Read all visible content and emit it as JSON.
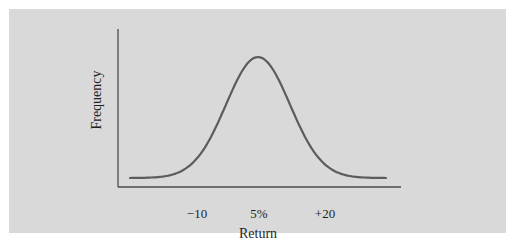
{
  "chart_data": {
    "type": "line",
    "title": "",
    "xlabel": "Return",
    "ylabel": "Frequency",
    "x_tick_labels": [
      "−10",
      "5%",
      "+20"
    ],
    "x_tick_values": [
      -10,
      5,
      20
    ],
    "series": [
      {
        "name": "Return distribution (normal curve)",
        "shape": "normal",
        "mean": 5,
        "std_dev": 7.5,
        "x": [
          -25,
          -20,
          -15,
          -10,
          -5,
          0,
          5,
          10,
          15,
          20,
          25,
          30,
          35
        ],
        "y": [
          0.03,
          0.06,
          0.18,
          0.42,
          0.68,
          0.9,
          1.0,
          0.9,
          0.68,
          0.42,
          0.18,
          0.06,
          0.03
        ]
      }
    ],
    "xlim": [
      -27,
      37
    ],
    "ylim": [
      0,
      1.12
    ],
    "grid": false,
    "legend": "none",
    "colors": {
      "background": "#d9d9d9",
      "curve": "#5a5a5a",
      "axes": "#4a4a4a"
    }
  }
}
